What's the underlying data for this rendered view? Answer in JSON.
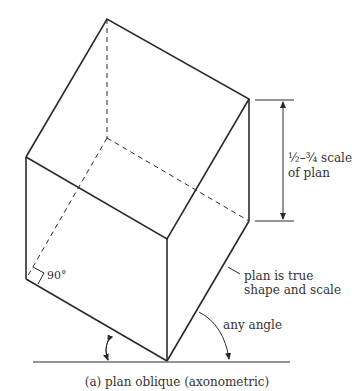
{
  "diagram": {
    "caption": "(a) plan oblique (axonometric)",
    "labels": {
      "scale_line1": "½–¾ scale",
      "scale_line2": "of plan",
      "right_angle": "90°",
      "true_shape_line1": "plan is true",
      "true_shape_line2": "shape and scale",
      "any_angle": "any angle"
    },
    "colors": {
      "line": "#2a2a2a",
      "text": "#333333",
      "background": "#ffffff"
    }
  }
}
